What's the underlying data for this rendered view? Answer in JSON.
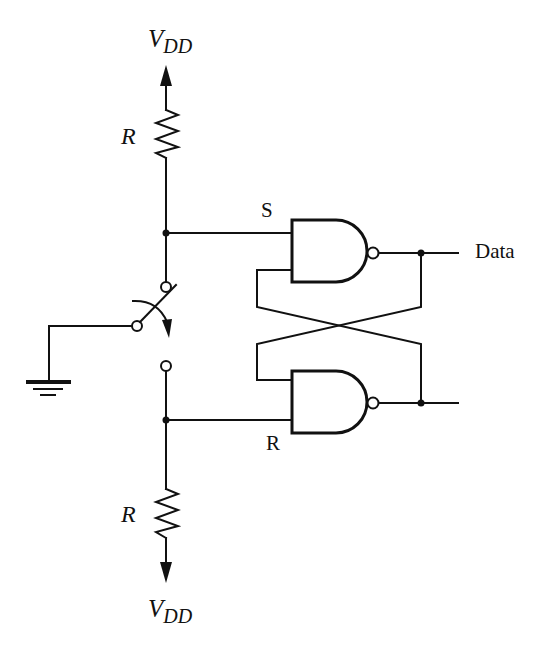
{
  "diagram": {
    "type": "circuit-schematic",
    "labels": {
      "vdd_top": {
        "main": "V",
        "sub": "DD"
      },
      "vdd_bottom": {
        "main": "V",
        "sub": "DD"
      },
      "resistor_top": "R",
      "resistor_bottom": "R",
      "set_input": "S",
      "reset_input": "R",
      "output": "Data"
    },
    "components": [
      {
        "id": "vdd-top",
        "kind": "supply-arrow",
        "label": "VDD"
      },
      {
        "id": "r-top",
        "kind": "resistor",
        "label": "R"
      },
      {
        "id": "switch",
        "kind": "spdt-switch"
      },
      {
        "id": "ground",
        "kind": "ground"
      },
      {
        "id": "r-bottom",
        "kind": "resistor",
        "label": "R"
      },
      {
        "id": "vdd-bottom",
        "kind": "supply-arrow",
        "label": "VDD"
      },
      {
        "id": "nand-top",
        "kind": "nand-gate",
        "inputs": [
          "S",
          "feedback"
        ]
      },
      {
        "id": "nand-bottom",
        "kind": "nand-gate",
        "inputs": [
          "feedback",
          "R"
        ]
      }
    ],
    "colors": {
      "ink": "#111111",
      "background": "#ffffff"
    }
  }
}
